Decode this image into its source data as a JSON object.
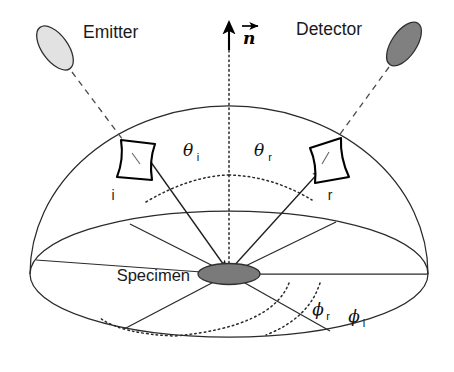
{
  "figure": {
    "background_color": "#ffffff"
  },
  "labels": {
    "emitter": "Emitter",
    "detector": "Detector",
    "specimen": "Specimen",
    "normal_vector": "n",
    "patch_incident": "i",
    "patch_reflected": "r",
    "theta_symbol": "θ",
    "phi_symbol": "ϕ",
    "subscript_incident": "i",
    "subscript_reflected": "r"
  },
  "angles": {
    "theta_i": {
      "symbol": "θ",
      "subscript": "i",
      "name": "polar angle of incidence"
    },
    "theta_r": {
      "symbol": "θ",
      "subscript": "r",
      "name": "polar angle of reflection"
    },
    "phi_i": {
      "symbol": "ϕ",
      "subscript": "i",
      "name": "azimuth angle of incidence"
    },
    "phi_r": {
      "symbol": "ϕ",
      "subscript": "r",
      "name": "azimuth angle of reflection"
    }
  },
  "colors": {
    "emitter_fill": "#e2e2e2",
    "detector_fill": "#808080",
    "specimen_fill": "#7a7a7a",
    "line": "#2a2a2a",
    "dashed_line": "#4a4a4a",
    "text": "#1a1a1a",
    "patch_fill": "#ffffff",
    "patch_stroke": "#000000"
  },
  "geometry": {
    "specimen_center": {
      "x": 229,
      "y": 274
    },
    "dome_radius_x": 199,
    "dome_radius_y": 168,
    "base_ellipse_rx": 199,
    "base_ellipse_ry": 63
  }
}
